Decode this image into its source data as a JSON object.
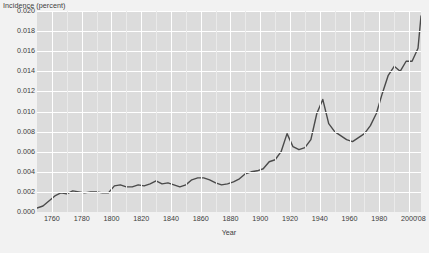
{
  "chart_data": {
    "type": "line",
    "title": "",
    "xlabel": "Year",
    "ylabel": "Incidence (percent)",
    "xlim": [
      1750,
      2008
    ],
    "ylim": [
      0.0,
      0.02
    ],
    "grid": true,
    "legend": "none",
    "y_ticks": [
      "0.000",
      "0.002",
      "0.004",
      "0.006",
      "0.008",
      "0.010",
      "0.012",
      "0.014",
      "0.016",
      "0.018",
      "0.020"
    ],
    "y_tick_values": [
      0.0,
      0.002,
      0.004,
      0.006,
      0.008,
      0.01,
      0.012,
      0.014,
      0.016,
      0.018,
      0.02
    ],
    "x_ticks": [
      "1760",
      "1780",
      "1800",
      "1820",
      "1840",
      "1860",
      "1880",
      "1900",
      "1920",
      "1940",
      "1960",
      "1980",
      "2000",
      "'08"
    ],
    "x_tick_values": [
      1760,
      1780,
      1800,
      1820,
      1840,
      1860,
      1880,
      1900,
      1920,
      1940,
      1960,
      1980,
      2000,
      2008
    ],
    "line_color": "#4a4a4a",
    "plot_background": "#dcdcdc",
    "page_background": "#f2f2f2",
    "gridline_color": "#ffffff",
    "series": [
      {
        "name": "Incidence",
        "x": [
          1750,
          1754,
          1758,
          1762,
          1766,
          1770,
          1774,
          1778,
          1782,
          1786,
          1790,
          1794,
          1798,
          1802,
          1806,
          1810,
          1814,
          1818,
          1822,
          1826,
          1830,
          1834,
          1838,
          1842,
          1846,
          1850,
          1854,
          1858,
          1862,
          1866,
          1870,
          1874,
          1878,
          1882,
          1886,
          1890,
          1894,
          1898,
          1902,
          1906,
          1910,
          1914,
          1918,
          1922,
          1926,
          1930,
          1934,
          1938,
          1942,
          1946,
          1950,
          1954,
          1958,
          1962,
          1966,
          1970,
          1974,
          1978,
          1982,
          1986,
          1990,
          1994,
          1998,
          2002,
          2006,
          2008
        ],
        "y": [
          0.0004,
          0.0006,
          0.0011,
          0.0016,
          0.0019,
          0.0018,
          0.0021,
          0.002,
          0.0019,
          0.002,
          0.002,
          0.0019,
          0.0019,
          0.0026,
          0.0027,
          0.0025,
          0.0025,
          0.0027,
          0.0026,
          0.0028,
          0.0031,
          0.0028,
          0.0029,
          0.0027,
          0.0025,
          0.0027,
          0.0032,
          0.0034,
          0.0034,
          0.0032,
          0.0029,
          0.0027,
          0.0028,
          0.003,
          0.0033,
          0.0038,
          0.004,
          0.0041,
          0.0043,
          0.005,
          0.0052,
          0.006,
          0.0078,
          0.0065,
          0.0062,
          0.0064,
          0.0072,
          0.0098,
          0.0112,
          0.0088,
          0.008,
          0.0076,
          0.0072,
          0.007,
          0.0074,
          0.0078,
          0.0086,
          0.0098,
          0.0118,
          0.0136,
          0.0145,
          0.014,
          0.015,
          0.015,
          0.0163,
          0.0195
        ]
      }
    ]
  }
}
